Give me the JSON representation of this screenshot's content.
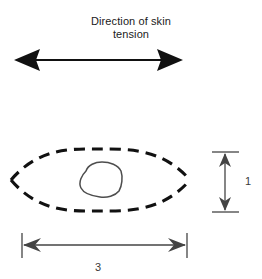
{
  "figure": {
    "background_color": "#ffffff",
    "stroke_color": "#111111",
    "thin_stroke_color": "#555555",
    "caption": "Direction of skin\ntension",
    "caption_line_1": "Direction of skin",
    "caption_line_2": "tension"
  },
  "tension_arrow": {
    "label": "skin-tension-double-arrow",
    "orientation": "horizontal",
    "double_headed": true,
    "x_start": 14,
    "x_end": 183,
    "y": 60
  },
  "excision_outline": {
    "label": "elliptical-excision-outline",
    "style": "dashed",
    "shape": "lens",
    "left_tip_x": 11,
    "right_tip_x": 190,
    "center_y": 180,
    "top_y": 150,
    "bottom_y": 211
  },
  "lesion": {
    "label": "central-lesion-blob",
    "style": "solid",
    "center_x": 100,
    "center_y": 180,
    "radius_x": 22,
    "radius_y": 17
  },
  "dimensions": {
    "width": {
      "name": "width-dimension",
      "value": "3",
      "axis": "horizontal",
      "x_start": 22,
      "x_end": 187,
      "y": 245
    },
    "height": {
      "name": "height-dimension",
      "value": "1",
      "axis": "vertical",
      "x": 225,
      "y_start": 152,
      "y_end": 212
    }
  }
}
